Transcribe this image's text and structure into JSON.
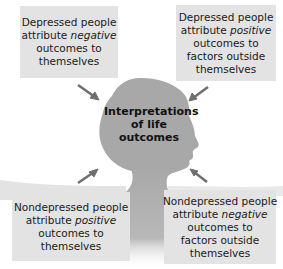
{
  "diagram": {
    "center": {
      "lines": [
        "Interpretations",
        "of life",
        "outcomes"
      ],
      "shape": "head-silhouette-icon"
    },
    "boxes": [
      {
        "position": "top-left",
        "lines": [
          "Depressed people",
          "attribute",
          "negative",
          "outcomes to",
          "themselves"
        ],
        "line1": "Depressed people",
        "line2_plain": "attribute ",
        "line2_italic": "negative",
        "line3": "outcomes to",
        "line4": "themselves",
        "line5": ""
      },
      {
        "position": "top-right",
        "line1": "Depressed people",
        "line2_plain": "attribute ",
        "line2_italic": "positive",
        "line3": "outcomes to",
        "line4": "factors outside",
        "line5": "themselves"
      },
      {
        "position": "bottom-left",
        "line1": "Nondepressed people",
        "line2_plain": "attribute ",
        "line2_italic": "positive",
        "line3": "outcomes to",
        "line4": "themselves",
        "line5": ""
      },
      {
        "position": "bottom-right",
        "line1": "Nondepressed people",
        "line2_plain": "attribute ",
        "line2_italic": "negative",
        "line3": "outcomes to",
        "line4": "factors outside",
        "line5": "themselves"
      }
    ],
    "arrows": [
      {
        "from": "top-left",
        "to": "center",
        "icon": "arrow-icon"
      },
      {
        "from": "top-right",
        "to": "center",
        "icon": "arrow-icon"
      },
      {
        "from": "bottom-left",
        "to": "center",
        "icon": "arrow-icon"
      },
      {
        "from": "bottom-right",
        "to": "center",
        "icon": "arrow-icon"
      }
    ],
    "colors": {
      "box_fill": "#e3e3e3",
      "silhouette": "#a8a8a8",
      "arrow": "#6e6e6e",
      "text": "#1a1a1a"
    }
  }
}
